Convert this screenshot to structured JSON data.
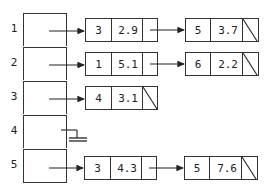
{
  "diagram": {
    "type": "hash-table-with-chaining",
    "buckets": [
      {
        "index": "1",
        "chain": [
          {
            "key": "3",
            "value": "2.9"
          },
          {
            "key": "5",
            "value": "3.7"
          }
        ]
      },
      {
        "index": "2",
        "chain": [
          {
            "key": "1",
            "value": "5.1"
          },
          {
            "key": "6",
            "value": "2.2"
          }
        ]
      },
      {
        "index": "3",
        "chain": [
          {
            "key": "4",
            "value": "3.1"
          }
        ]
      },
      {
        "index": "4",
        "chain": [],
        "null_pointer": true
      },
      {
        "index": "5",
        "chain": [
          {
            "key": "3",
            "value": "4.3"
          },
          {
            "key": "5",
            "value": "7.6"
          }
        ]
      }
    ]
  }
}
